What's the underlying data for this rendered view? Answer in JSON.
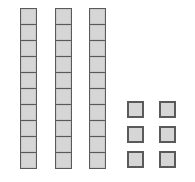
{
  "diagram": {
    "ten_rods": {
      "count": 3,
      "cubes_per_rod": 10,
      "positions_x": [
        20,
        55,
        89
      ],
      "top_y": 8,
      "height": 161
    },
    "unit_cubes": {
      "count": 6,
      "layout": "2 columns x 3 rows",
      "positions": [
        {
          "x": 127,
          "y": 101
        },
        {
          "x": 159,
          "y": 101
        },
        {
          "x": 127,
          "y": 126
        },
        {
          "x": 159,
          "y": 126
        },
        {
          "x": 127,
          "y": 151
        },
        {
          "x": 159,
          "y": 151
        }
      ]
    },
    "represented_value": 36,
    "colors": {
      "fill": "#d6d6d6",
      "stroke": "#5a5a5a",
      "background": "#ffffff"
    }
  }
}
